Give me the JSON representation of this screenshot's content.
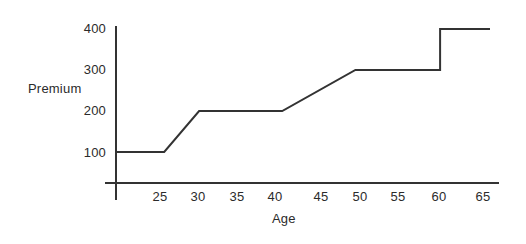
{
  "chart_data": {
    "type": "line",
    "title": "",
    "subtitle": "",
    "xlabel": "Age",
    "ylabel": "Premium",
    "xlim": [
      20,
      65
    ],
    "ylim": [
      0,
      400
    ],
    "grid": false,
    "legend": false,
    "legend_position": "none",
    "xticks": [
      25,
      30,
      35,
      40,
      45,
      50,
      55,
      60,
      65
    ],
    "xtick_labels": [
      "25",
      "30",
      "35",
      "40",
      "45",
      "50",
      "55",
      "60",
      "65"
    ],
    "yticks": [
      100,
      200,
      300,
      400
    ],
    "ytick_labels": [
      "100",
      "200",
      "300",
      "400"
    ],
    "series": [
      {
        "name": "Premium by Age",
        "color": "#333333",
        "x": [
          20,
          25.8,
          30,
          40,
          48.8,
          59,
          59,
          65
        ],
        "values": [
          100,
          100,
          200,
          200,
          300,
          300,
          400,
          400
        ]
      }
    ],
    "annotations": []
  },
  "axis_labels": {
    "y_400": "400",
    "y_300": "300",
    "y_200": "200",
    "y_100": "100",
    "y_title": "Premium",
    "x_25": "25",
    "x_30": "30",
    "x_35": "35",
    "x_40": "40",
    "x_45": "45",
    "x_50": "50",
    "x_55": "55",
    "x_60": "60",
    "x_65": "65",
    "x_title": "Age"
  },
  "style": {
    "line_color": "#333333",
    "axis_color": "#333333",
    "text_color": "#2b2b2b",
    "background": "#ffffff"
  }
}
